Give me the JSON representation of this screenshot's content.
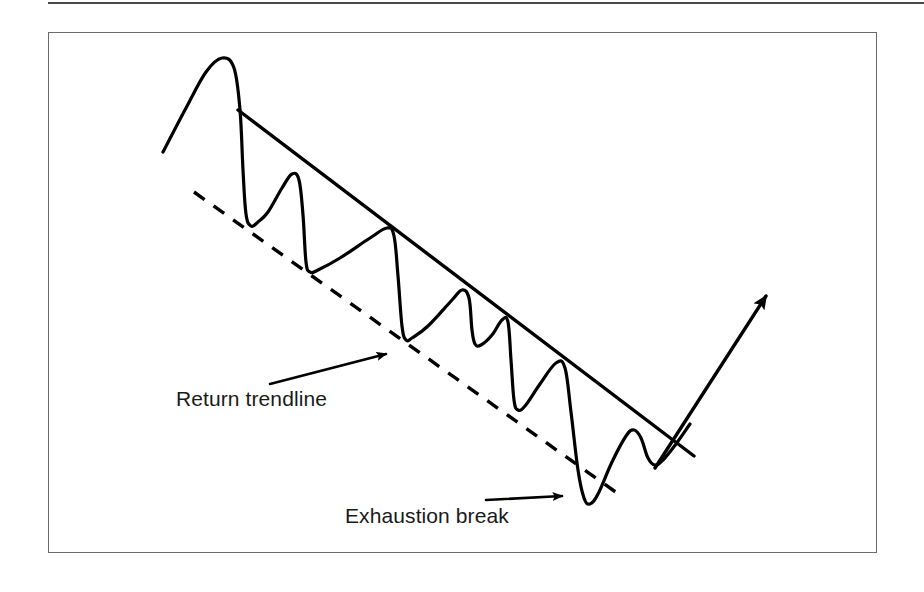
{
  "page": {
    "background_color": "#ffffff",
    "ink_color": "#000000",
    "frame_color": "#6b6b6b",
    "rule_color": "#4a4a4a"
  },
  "figure": {
    "frame": {
      "x": 48,
      "y": 32,
      "width": 829,
      "height": 521
    },
    "top_rule": {
      "x": 48,
      "y": 2,
      "width": 876
    }
  },
  "annotations": [
    {
      "id": "return-trendline",
      "label": "Return trendline",
      "arrow_from": {
        "x": 270,
        "y": 384
      },
      "arrow_to": {
        "x": 386,
        "y": 354
      }
    },
    {
      "id": "exhaustion-break",
      "label": "Exhaustion break",
      "arrow_from": {
        "x": 486,
        "y": 500
      },
      "arrow_to": {
        "x": 562,
        "y": 496
      }
    }
  ],
  "chart_data": {
    "type": "line",
    "title": "",
    "subtitle": "",
    "xlabel": "",
    "ylabel": "",
    "grid": false,
    "legend": null,
    "axis_visible": false,
    "xlim": [
      48,
      877
    ],
    "ylim": [
      32,
      553
    ],
    "y_axis_inverted": true,
    "series": [
      {
        "name": "price-wave",
        "style": "solid",
        "stroke": "#000000",
        "stroke_width": 3.2,
        "points": [
          {
            "x": 163,
            "y": 152
          },
          {
            "x": 186,
            "y": 108
          },
          {
            "x": 206,
            "y": 72
          },
          {
            "x": 222,
            "y": 58
          },
          {
            "x": 234,
            "y": 68
          },
          {
            "x": 240,
            "y": 110
          },
          {
            "x": 243,
            "y": 170
          },
          {
            "x": 246,
            "y": 214
          },
          {
            "x": 251,
            "y": 226
          },
          {
            "x": 258,
            "y": 222
          },
          {
            "x": 268,
            "y": 212
          },
          {
            "x": 282,
            "y": 188
          },
          {
            "x": 292,
            "y": 174
          },
          {
            "x": 299,
            "y": 180
          },
          {
            "x": 303,
            "y": 215
          },
          {
            "x": 306,
            "y": 262
          },
          {
            "x": 310,
            "y": 272
          },
          {
            "x": 318,
            "y": 270
          },
          {
            "x": 340,
            "y": 258
          },
          {
            "x": 370,
            "y": 238
          },
          {
            "x": 387,
            "y": 228
          },
          {
            "x": 394,
            "y": 236
          },
          {
            "x": 398,
            "y": 276
          },
          {
            "x": 402,
            "y": 326
          },
          {
            "x": 406,
            "y": 340
          },
          {
            "x": 412,
            "y": 338
          },
          {
            "x": 428,
            "y": 326
          },
          {
            "x": 452,
            "y": 300
          },
          {
            "x": 462,
            "y": 290
          },
          {
            "x": 469,
            "y": 298
          },
          {
            "x": 472,
            "y": 330
          },
          {
            "x": 475,
            "y": 344
          },
          {
            "x": 481,
            "y": 345
          },
          {
            "x": 492,
            "y": 335
          },
          {
            "x": 502,
            "y": 320
          },
          {
            "x": 508,
            "y": 322
          },
          {
            "x": 511,
            "y": 360
          },
          {
            "x": 514,
            "y": 400
          },
          {
            "x": 518,
            "y": 410
          },
          {
            "x": 525,
            "y": 406
          },
          {
            "x": 540,
            "y": 384
          },
          {
            "x": 556,
            "y": 363
          },
          {
            "x": 565,
            "y": 368
          },
          {
            "x": 571,
            "y": 412
          },
          {
            "x": 578,
            "y": 470
          },
          {
            "x": 584,
            "y": 498
          },
          {
            "x": 590,
            "y": 504
          },
          {
            "x": 598,
            "y": 494
          },
          {
            "x": 612,
            "y": 462
          },
          {
            "x": 626,
            "y": 436
          },
          {
            "x": 634,
            "y": 430
          },
          {
            "x": 641,
            "y": 438
          },
          {
            "x": 648,
            "y": 458
          },
          {
            "x": 655,
            "y": 465
          },
          {
            "x": 663,
            "y": 460
          },
          {
            "x": 676,
            "y": 444
          },
          {
            "x": 690,
            "y": 424
          }
        ]
      }
    ],
    "trendlines": [
      {
        "name": "main-downtrend-line",
        "role": "upper-boundary-resistance",
        "style": "solid",
        "stroke": "#000000",
        "stroke_width": 3.4,
        "from": {
          "x": 238,
          "y": 110
        },
        "to": {
          "x": 694,
          "y": 456
        }
      },
      {
        "name": "return-trendline",
        "role": "lower-boundary-support",
        "style": "dashed",
        "stroke": "#000000",
        "stroke_width": 3.4,
        "dash": "13 11",
        "from": {
          "x": 194,
          "y": 192
        },
        "to": {
          "x": 624,
          "y": 498
        }
      }
    ],
    "breakout_arrow": {
      "name": "breakout-rally-arrow",
      "stroke": "#000000",
      "stroke_width": 3.4,
      "from": {
        "x": 655,
        "y": 468
      },
      "to": {
        "x": 766,
        "y": 296
      }
    },
    "key_levels": [
      {
        "name": "first-peak",
        "x": 222,
        "y": 58
      },
      {
        "name": "exhaustion-low",
        "x": 588,
        "y": 504
      },
      {
        "name": "breakout-cross",
        "x": 676,
        "y": 444
      }
    ]
  }
}
